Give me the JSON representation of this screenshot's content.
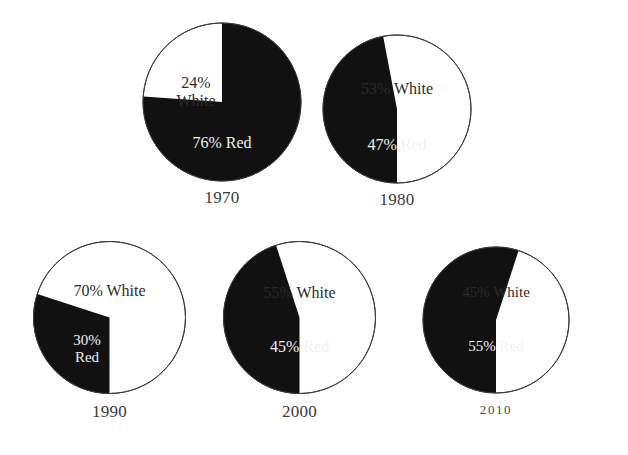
{
  "chart_data": {
    "type": "pie",
    "title": "",
    "subtitle": "",
    "xlabel": "",
    "ylabel": "",
    "legend": "none",
    "grid": false,
    "categories": [
      "Red",
      "White"
    ],
    "colors": {
      "red_slice": "#111111",
      "white_slice": "#ffffff",
      "outline": "#3a3a3a",
      "background": "#ffffff",
      "label_on_dark": "#f2f2f0",
      "label_on_light": "#2b2b2b"
    },
    "charts": [
      {
        "year": "1970",
        "slices": [
          {
            "name": "Red",
            "value": 76,
            "label": "76% Red"
          },
          {
            "name": "White",
            "value": 24,
            "label": "24%\nWhite"
          }
        ]
      },
      {
        "year": "1980",
        "slices": [
          {
            "name": "Red",
            "value": 47,
            "label": "47% Red"
          },
          {
            "name": "White",
            "value": 53,
            "label": "53% White"
          }
        ]
      },
      {
        "year": "1990",
        "slices": [
          {
            "name": "Red",
            "value": 30,
            "label": "30%\nRed"
          },
          {
            "name": "White",
            "value": 70,
            "label": "70% White"
          }
        ]
      },
      {
        "year": "2000",
        "slices": [
          {
            "name": "Red",
            "value": 45,
            "label": "45% Red"
          },
          {
            "name": "White",
            "value": 55,
            "label": "55% White"
          }
        ]
      },
      {
        "year": "2010",
        "slices": [
          {
            "name": "Red",
            "value": 55,
            "label": "55% Red"
          },
          {
            "name": "White",
            "value": 45,
            "label": "45% White"
          }
        ]
      }
    ]
  },
  "figures": [
    {
      "id": "pie-1970",
      "year": "1970",
      "year_style": "lining",
      "year_font_size": "17px",
      "box": {
        "left": 142,
        "top": 22,
        "size": 160
      },
      "radius": 79,
      "red_label": "76% Red",
      "white_label": "24%\nWhite",
      "red_label_pos": {
        "left": 0,
        "top": 112,
        "width": 160,
        "font_size": "16px"
      },
      "white_label_pos": {
        "left": 6,
        "top": 52,
        "width": 96,
        "font_size": "16px"
      },
      "red_path_start_deg": 0,
      "red_path_sweep_deg": 274,
      "label_year_top": 166
    },
    {
      "id": "pie-1980",
      "year": "1980",
      "year_style": "lining",
      "year_font_size": "17px",
      "box": {
        "left": 322,
        "top": 34,
        "size": 150
      },
      "radius": 74,
      "red_label": "47% Red",
      "white_label": "53% White",
      "red_label_pos": {
        "left": 0,
        "top": 102,
        "width": 150,
        "font_size": "16px"
      },
      "white_label_pos": {
        "left": 0,
        "top": 46,
        "width": 150,
        "font_size": "16px"
      },
      "red_path_start_deg": 180,
      "red_path_sweep_deg": 169.2,
      "label_year_top": 156
    },
    {
      "id": "pie-1990",
      "year": "1990",
      "year_style": "lining",
      "year_font_size": "17px",
      "box": {
        "left": 32,
        "top": 240,
        "size": 155
      },
      "radius": 76,
      "red_label": "30%\nRed",
      "white_label": "70% White",
      "red_label_pos": {
        "left": 14,
        "top": 92,
        "width": 82,
        "font_size": "15px"
      },
      "white_label_pos": {
        "left": 0,
        "top": 42,
        "width": 155,
        "font_size": "16px"
      },
      "red_path_start_deg": 180,
      "red_path_sweep_deg": 108,
      "label_year_top": 162
    },
    {
      "id": "pie-2000",
      "year": "2000",
      "year_style": "lining",
      "year_font_size": "17px",
      "box": {
        "left": 222,
        "top": 240,
        "size": 155
      },
      "radius": 76,
      "red_label": "45% Red",
      "white_label": "55% White",
      "red_label_pos": {
        "left": 0,
        "top": 98,
        "width": 155,
        "font_size": "16px"
      },
      "white_label_pos": {
        "left": 0,
        "top": 44,
        "width": 155,
        "font_size": "16px"
      },
      "red_path_start_deg": 180,
      "red_path_sweep_deg": 162,
      "label_year_top": 162
    },
    {
      "id": "pie-2010",
      "year": "2010",
      "year_style": "oldstyle",
      "year_font_size": "13px",
      "box": {
        "left": 422,
        "top": 246,
        "size": 148
      },
      "radius": 73,
      "red_label": "55% Red",
      "white_label": "45% White",
      "red_label_pos": {
        "left": 0,
        "top": 92,
        "width": 148,
        "font_size": "15px"
      },
      "white_label_pos": {
        "left": 0,
        "top": 38,
        "width": 148,
        "font_size": "15px"
      },
      "red_path_start_deg": 180,
      "red_path_sweep_deg": 198,
      "label_year_top": 156
    }
  ]
}
